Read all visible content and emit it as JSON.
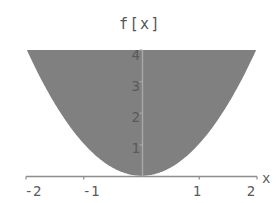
{
  "chart_data": {
    "type": "area",
    "title": "f[x]",
    "xlabel": "x",
    "ylabel": "f[x]",
    "xlim": [
      -2,
      2
    ],
    "ylim": [
      0,
      4
    ],
    "grid": false,
    "legend": null,
    "fill_color": "#808080",
    "curve_color": "#ffffff",
    "axis_color": "#9a9a9a",
    "text_color": "#5a5a5a",
    "shaded_region": "between curve and top of plot frame",
    "function": "x^2",
    "x": [
      -2,
      -1.75,
      -1.5,
      -1.25,
      -1,
      -0.75,
      -0.5,
      -0.25,
      0,
      0.25,
      0.5,
      0.75,
      1,
      1.25,
      1.5,
      1.75,
      2
    ],
    "values": [
      4,
      3.0625,
      2.25,
      1.5625,
      1,
      0.5625,
      0.25,
      0.0625,
      0,
      0.0625,
      0.25,
      0.5625,
      1,
      1.5625,
      2.25,
      3.0625,
      4
    ],
    "xticks": [
      -2,
      -1,
      1,
      2
    ],
    "xtick_labels": [
      "-2",
      "-1",
      "1",
      "2"
    ],
    "yticks": [
      1,
      2,
      3,
      4
    ],
    "ytick_labels": [
      "1",
      "2",
      "3",
      "4"
    ]
  }
}
